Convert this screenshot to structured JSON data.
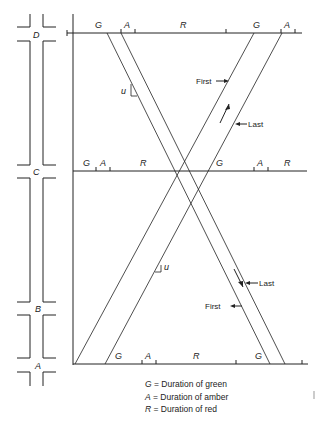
{
  "diagram": {
    "type": "time-space diagram",
    "intersections": [
      {
        "id": "D",
        "label": "D",
        "phases": [
          "G",
          "A",
          "R",
          "G",
          "A"
        ]
      },
      {
        "id": "C",
        "label": "C",
        "phases": [
          "G",
          "A",
          "R",
          "G",
          "A",
          "R"
        ]
      },
      {
        "id": "B",
        "label": "B",
        "phases": []
      },
      {
        "id": "A",
        "label": "A",
        "phases": [
          "G",
          "A",
          "R",
          "G"
        ]
      }
    ],
    "bands": {
      "northbound": {
        "first_label": "First",
        "last_label": "Last",
        "angle_label": "u"
      },
      "southbound": {
        "first_label": "First",
        "last_label": "Last",
        "angle_label": "u"
      }
    },
    "colors": {
      "line": "#222222",
      "background": "#ffffff"
    }
  },
  "legend": [
    {
      "symbol": "G",
      "text": "= Duration of green"
    },
    {
      "symbol": "A",
      "text": "= Duration of amber"
    },
    {
      "symbol": "R",
      "text": "= Duration of red"
    }
  ]
}
